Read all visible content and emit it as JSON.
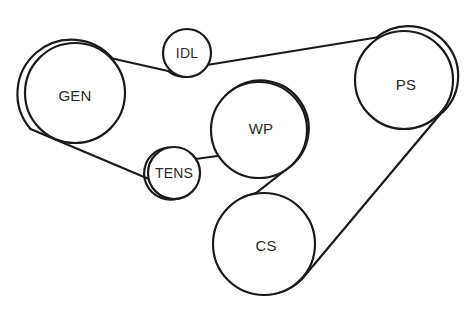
{
  "diagram": {
    "type": "belt-routing",
    "canvas": {
      "width": 476,
      "height": 325
    },
    "stroke_color": "#1a1a1a",
    "background_color": "#ffffff",
    "label_color": "#2a2a2a",
    "pulleys": [
      {
        "id": "gen",
        "label": "GEN",
        "cx": 75,
        "cy": 93,
        "r": 50,
        "label_x": 75,
        "label_y": 95
      },
      {
        "id": "idl",
        "label": "IDL",
        "cx": 187,
        "cy": 53,
        "r": 24,
        "label_x": 187,
        "label_y": 53
      },
      {
        "id": "tens",
        "label": "TENS",
        "cx": 174,
        "cy": 173,
        "r": 26,
        "label_x": 174,
        "label_y": 173
      },
      {
        "id": "wp",
        "label": "WP",
        "cx": 259,
        "cy": 130,
        "r": 48,
        "label_x": 261,
        "label_y": 128
      },
      {
        "id": "cs",
        "label": "CS",
        "cx": 264,
        "cy": 244,
        "r": 51,
        "label_x": 266,
        "label_y": 245
      },
      {
        "id": "ps",
        "label": "PS",
        "cx": 404,
        "cy": 80,
        "r": 49,
        "label_x": 406,
        "label_y": 84
      }
    ],
    "belt_segments": [
      {
        "id": "gen-to-idl",
        "from": "gen",
        "to": "idl",
        "description": "GEN top-right to IDL underside"
      },
      {
        "id": "idl-to-ps",
        "from": "idl",
        "to": "ps",
        "description": "IDL underside to PS top-left"
      },
      {
        "id": "ps-to-cs",
        "from": "ps",
        "to": "cs",
        "description": "PS lower-right to CS lower-right"
      },
      {
        "id": "cs-to-wp",
        "from": "cs",
        "to": "wp",
        "description": "CS upper-left crossing to WP lower-right"
      },
      {
        "id": "wp-to-tens",
        "from": "wp",
        "to": "tens",
        "description": "WP left to TENS right"
      },
      {
        "id": "tens-to-gen",
        "from": "tens",
        "to": "gen",
        "description": "TENS underside to GEN lower-left"
      }
    ]
  }
}
